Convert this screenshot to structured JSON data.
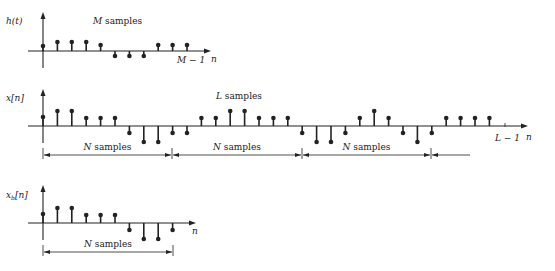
{
  "plots": {
    "h": {
      "ylabel": "h(t)",
      "annotation": "M samples",
      "end_label": "M − 1",
      "xlabel": "n",
      "values": [
        5,
        9,
        9,
        9,
        6,
        -5,
        -5,
        -5,
        6,
        6,
        6
      ]
    },
    "x": {
      "ylabel": "x[n]",
      "annotation": "L samples",
      "end_label": "L − 1",
      "xlabel": "n",
      "values": [
        9,
        15,
        15,
        8,
        8,
        8,
        -7,
        -16,
        -16,
        -7,
        -7,
        8,
        8,
        15,
        15,
        8,
        8,
        8,
        -7,
        -16,
        -16,
        -7,
        8,
        15,
        8,
        -7,
        -16,
        -7,
        8,
        8,
        8,
        8
      ],
      "segments": [
        "N samples",
        "N samples",
        "N samples"
      ]
    },
    "xb": {
      "ylabel": "x_b[n]",
      "ylabel_main": "x",
      "ylabel_sub": "b",
      "ylabel_rest": "[n]",
      "xlabel": "n",
      "values": [
        9,
        15,
        15,
        8,
        8,
        8,
        -7,
        -16,
        -16,
        -7
      ],
      "segment": "N samples"
    }
  }
}
